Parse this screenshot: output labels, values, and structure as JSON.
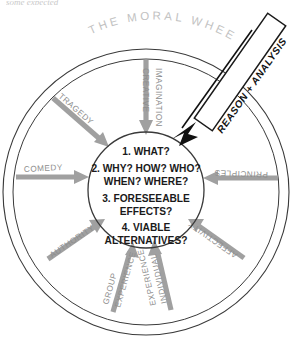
{
  "page": {
    "cropped_header_text": "some expected",
    "title": "THE MORAL WHEEL"
  },
  "hub": {
    "lines": [
      "1. WHAT?",
      "2. WHY? HOW? WHO?",
      "WHEN? WHERE?",
      "3. FORESEEABLE",
      "EFFECTS?",
      "4. VIABLE",
      "ALTERNATIVES?"
    ]
  },
  "banner": {
    "label": "REASON + ANALYSIS"
  },
  "spokes": [
    {
      "id": "creative-imagination",
      "line1": "CREATIVE",
      "line2": "IMAGINATION"
    },
    {
      "id": "principles",
      "line1": "PRINCIPLES",
      "line2": ""
    },
    {
      "id": "affectivity",
      "line1": "AFFECTIVITY",
      "line2": ""
    },
    {
      "id": "individual-experience",
      "line1": "INDIVIDUAL",
      "line2": "EXPERIENCE"
    },
    {
      "id": "group-experience",
      "line1": "GROUP",
      "line2": "EXPERIENCE"
    },
    {
      "id": "authority",
      "line1": "AUTHORITY",
      "line2": ""
    },
    {
      "id": "comedy",
      "line1": "COMEDY",
      "line2": ""
    },
    {
      "id": "tragedy",
      "line1": "TRAGEDY",
      "line2": ""
    }
  ],
  "colors": {
    "spoke": "#a0a0a0",
    "rim": "#3a3a3a",
    "title": "#c2c2c2",
    "hub_text": "#1a1a1a",
    "banner_border": "#111111",
    "background": "#ffffff"
  }
}
